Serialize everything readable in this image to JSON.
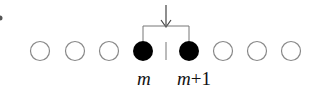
{
  "diagram": {
    "circles": [
      {
        "state": "empty"
      },
      {
        "state": "empty"
      },
      {
        "state": "empty"
      },
      {
        "state": "filled"
      },
      {
        "state": "filled"
      },
      {
        "state": "empty"
      },
      {
        "state": "empty"
      },
      {
        "state": "empty"
      }
    ],
    "labels": {
      "left": "m",
      "right_var": "m",
      "right_op": "+1"
    },
    "arrow": "down-arrow",
    "colors": {
      "filled": "#000000",
      "outline": "#888888",
      "line": "#777777"
    }
  }
}
